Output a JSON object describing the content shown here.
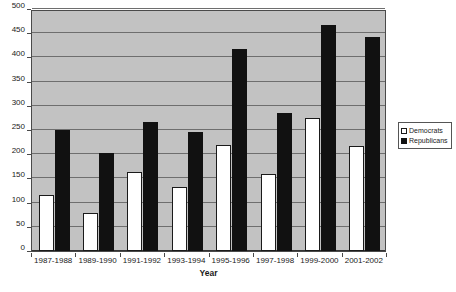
{
  "chart_data": {
    "type": "bar",
    "title": "",
    "xlabel": "Year",
    "ylabel": "",
    "categories": [
      "1987-1988",
      "1989-1990",
      "1991-1992",
      "1993-1994",
      "1995-1996",
      "1997-1998",
      "1999-2000",
      "2001-2002"
    ],
    "series": [
      {
        "name": "Democrats",
        "color": "#ffffff",
        "values": [
          115,
          78,
          163,
          133,
          220,
          160,
          274,
          216
        ]
      },
      {
        "name": "Republicans",
        "color": "#111111",
        "values": [
          251,
          202,
          266,
          245,
          417,
          285,
          466,
          442
        ]
      }
    ],
    "ylim": [
      0,
      500
    ],
    "ytick_step": 50,
    "yticks": [
      0,
      50,
      100,
      150,
      200,
      250,
      300,
      350,
      400,
      450,
      500
    ],
    "ytick_labels": [
      "0",
      "50",
      "100",
      "150",
      "200",
      "250",
      "300",
      "350",
      "400",
      "450",
      "500"
    ],
    "grid": true,
    "grid_axis": "y",
    "legend_position": "right",
    "plot_background": "#c2c2c2",
    "figure_background": "#ffffff",
    "gridline_color": "#6e6e6e",
    "axis_color": "#4a4a4a"
  }
}
